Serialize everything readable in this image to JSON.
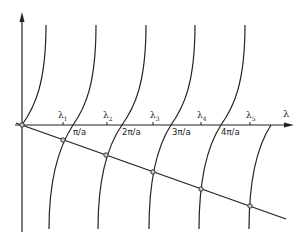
{
  "diagram": {
    "type": "graphical-solution",
    "x_axis_label": "λ",
    "tick_labels": [
      "π/a",
      "2π/a",
      "3π/a",
      "4π/a"
    ],
    "roots": [
      {
        "symbol": "λ",
        "sub": "1"
      },
      {
        "symbol": "λ",
        "sub": "2"
      },
      {
        "symbol": "λ",
        "sub": "3"
      },
      {
        "symbol": "λ",
        "sub": "4"
      },
      {
        "symbol": "λ",
        "sub": "5"
      }
    ],
    "colors": {
      "ink": "#222222",
      "point_fill": "#cfcfcf",
      "background": "#ffffff"
    }
  }
}
